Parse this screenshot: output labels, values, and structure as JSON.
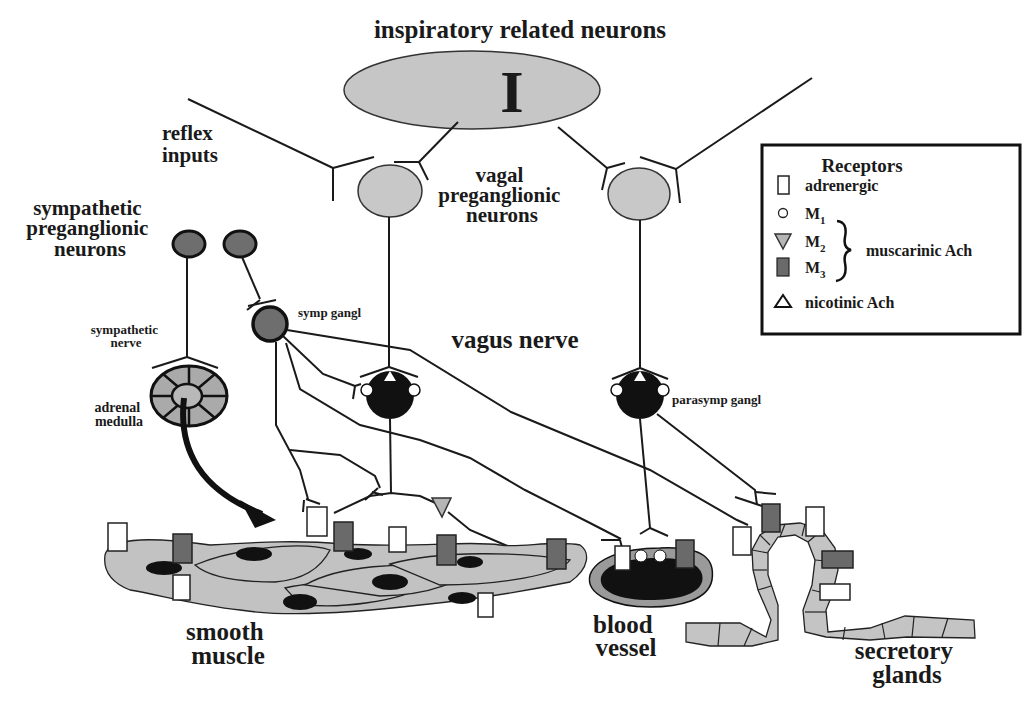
{
  "title": "inspiratory related neurons",
  "center_neuron": {
    "label": "I"
  },
  "labels": {
    "reflex_inputs": [
      "reflex",
      "inputs"
    ],
    "vagal_preganglionic": [
      "vagal",
      "preganglionic",
      "neurons"
    ],
    "sympathetic_preganglionic": [
      "sympathetic",
      "preganglionic",
      "neurons"
    ],
    "symp_gangl": "symp gangl",
    "sympathetic_nerve": [
      "sympathetic",
      "nerve"
    ],
    "adrenal_medulla": [
      "adrenal",
      "medulla"
    ],
    "vagus_nerve": "vagus nerve",
    "parasymp_gangl": "parasymp gangl",
    "smooth_muscle": [
      "smooth",
      "muscle"
    ],
    "blood_vessel": [
      "blood",
      "vessel"
    ],
    "secretory_glands": [
      "secretory",
      "glands"
    ]
  },
  "legend": {
    "title": "Receptors",
    "items": [
      {
        "icon": "white-rectangle",
        "label": "adrenergic"
      },
      {
        "icon": "small-circle",
        "label": "M",
        "sub": "1"
      },
      {
        "icon": "gray-down-triangle",
        "label": "M",
        "sub": "2"
      },
      {
        "icon": "dark-rectangle",
        "label": "M",
        "sub": "3"
      },
      {
        "icon": "open-up-triangle",
        "label": "nicotinic Ach"
      }
    ],
    "group_label": "muscarinic Ach"
  },
  "colors": {
    "light_neuron": "#c8c8c8",
    "dark_neuron": "#6e6e6e",
    "ganglion": "#111111",
    "tissue": "#c2c2c2"
  }
}
